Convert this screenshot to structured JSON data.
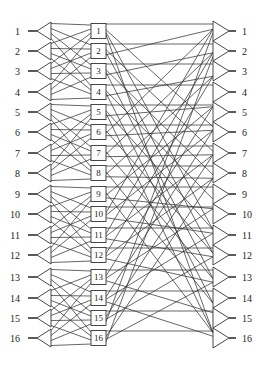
{
  "diagram": {
    "type": "three-stage interconnection network",
    "line_color": "#333333",
    "background": "#ffffff",
    "inputs": [
      "1",
      "2",
      "3",
      "4",
      "5",
      "6",
      "7",
      "8",
      "9",
      "10",
      "11",
      "12",
      "13",
      "14",
      "15",
      "16"
    ],
    "middle_boxes": [
      "1",
      "2",
      "3",
      "4",
      "5",
      "6",
      "7",
      "8",
      "9",
      "10",
      "11",
      "12",
      "13",
      "14",
      "15",
      "16"
    ],
    "outputs": [
      "1",
      "2",
      "3",
      "4",
      "5",
      "6",
      "7",
      "8",
      "9",
      "10",
      "11",
      "12",
      "13",
      "14",
      "15",
      "16"
    ],
    "row_y": [
      31,
      51,
      71,
      92,
      112,
      132,
      153,
      173,
      194,
      214,
      235,
      255,
      277,
      298,
      318,
      338
    ],
    "group_size": 4,
    "stage1_note": "each input splitter fans out to the 4 boxes of its group of 4",
    "stage2_note": "each box connects horizontally to the same-index output and diagonally (perfect shuffle) to other outputs"
  }
}
